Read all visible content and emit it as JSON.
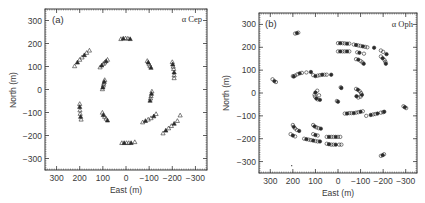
{
  "chart_data": [
    {
      "type": "scatter",
      "panel_label": "(a)",
      "title": "α Cep",
      "xlabel": "East (m)",
      "ylabel": "North (m)",
      "xlim": [
        350,
        -350
      ],
      "ylim": [
        -350,
        350
      ],
      "xticks": [
        300,
        200,
        100,
        0,
        -100,
        -200,
        -300
      ],
      "yticks": [
        300,
        200,
        100,
        0,
        -100,
        -200,
        -300
      ],
      "xtick_labels": [
        "300",
        "200",
        "100",
        "0",
        "−100",
        "−200",
        "−300"
      ],
      "ytick_labels": [
        "300",
        "200",
        "100",
        "0",
        "−100",
        "−200",
        "−300"
      ],
      "grid": false,
      "marker": "triangle",
      "series": [
        {
          "name": "top",
          "points": [
            [
              22,
              220
            ],
            [
              12,
              222
            ],
            [
              2,
              223
            ],
            [
              -8,
              222
            ],
            [
              -18,
              220
            ]
          ]
        },
        {
          "name": "upper-left-arc",
          "points": [
            [
              222,
              102
            ],
            [
              210,
              118
            ],
            [
              200,
              130
            ],
            [
              190,
              140
            ],
            [
              180,
              150
            ],
            [
              170,
              160
            ],
            [
              158,
              170
            ]
          ]
        },
        {
          "name": "inner-upper-left",
          "points": [
            [
              112,
              97
            ],
            [
              105,
              105
            ],
            [
              98,
              112
            ],
            [
              92,
              118
            ],
            [
              86,
              124
            ],
            [
              80,
              130
            ]
          ]
        },
        {
          "name": "inner-left",
          "points": [
            [
              102,
              2
            ],
            [
              100,
              10
            ],
            [
              98,
              18
            ],
            [
              96,
              26
            ],
            [
              94,
              34
            ],
            [
              92,
              42
            ]
          ]
        },
        {
          "name": "inner-upper-right",
          "points": [
            [
              -92,
              125
            ],
            [
              -96,
              118
            ],
            [
              -100,
              110
            ],
            [
              -104,
              102
            ],
            [
              -108,
              95
            ]
          ]
        },
        {
          "name": "far-upper-right",
          "points": [
            [
              -200,
              120
            ],
            [
              -202,
              110
            ],
            [
              -204,
              100
            ],
            [
              -206,
              90
            ],
            [
              -208,
              75
            ],
            [
              -208,
              62
            ],
            [
              -208,
              50
            ]
          ]
        },
        {
          "name": "inner-right",
          "points": [
            [
              -112,
              -8
            ],
            [
              -110,
              -18
            ],
            [
              -108,
              -28
            ],
            [
              -106,
              -38
            ],
            [
              -104,
              -48
            ]
          ]
        },
        {
          "name": "left-lower",
          "points": [
            [
              200,
              -62
            ],
            [
              200,
              -75
            ],
            [
              199,
              -90
            ],
            [
              198,
              -105
            ],
            [
              196,
              -118
            ],
            [
              194,
              -130
            ]
          ]
        },
        {
          "name": "inner-lower-left",
          "points": [
            [
              102,
              -100
            ],
            [
              98,
              -110
            ],
            [
              92,
              -118
            ],
            [
              86,
              -126
            ],
            [
              80,
              -134
            ]
          ]
        },
        {
          "name": "inner-lower-right",
          "points": [
            [
              -72,
              -142
            ],
            [
              -84,
              -136
            ],
            [
              -96,
              -130
            ],
            [
              -108,
              -124
            ],
            [
              -120,
              -116
            ],
            [
              -130,
              -106
            ]
          ]
        },
        {
          "name": "lower-right-arc",
          "points": [
            [
              -160,
              -190
            ],
            [
              -172,
              -178
            ],
            [
              -184,
              -168
            ],
            [
              -196,
              -158
            ],
            [
              -208,
              -148
            ],
            [
              -222,
              -136
            ],
            [
              -234,
              -112
            ]
          ]
        },
        {
          "name": "bottom",
          "points": [
            [
              18,
              -232
            ],
            [
              8,
              -232
            ],
            [
              -2,
              -232
            ],
            [
              -12,
              -232
            ],
            [
              -22,
              -232
            ],
            [
              -38,
              -228
            ]
          ]
        }
      ]
    },
    {
      "type": "scatter",
      "panel_label": "(b)",
      "title": "α Oph",
      "xlabel": "East (m)",
      "ylabel": "North (m)",
      "xlim": [
        350,
        -350
      ],
      "ylim": [
        -350,
        350
      ],
      "xticks": [
        300,
        200,
        100,
        0,
        -100,
        -200,
        -300
      ],
      "yticks": [
        300,
        200,
        100,
        0,
        -100,
        -200,
        -300
      ],
      "xtick_labels": [
        "300",
        "200",
        "100",
        "0",
        "−100",
        "−200",
        "−300"
      ],
      "ytick_labels": [
        "300",
        "200",
        "100",
        "0",
        "−100",
        "−200",
        "−300"
      ],
      "grid": false,
      "marker": "circle",
      "series": [
        {
          "name": "upper-left-pair",
          "points": [
            [
              190,
              260
            ],
            [
              182,
              262
            ],
            [
              176,
              264
            ]
          ]
        },
        {
          "name": "top-row-1",
          "points": [
            [
              0,
              218
            ],
            [
              -10,
              218
            ],
            [
              -20,
              218
            ],
            [
              -30,
              217
            ],
            [
              -40,
              216
            ],
            [
              -50,
              216
            ],
            [
              -70,
              212
            ],
            [
              -80,
              210
            ],
            [
              -90,
              208
            ],
            [
              -100,
              206
            ],
            [
              -110,
              204
            ],
            [
              -120,
              202
            ],
            [
              -130,
              200
            ],
            [
              -160,
              198
            ],
            [
              -190,
              186
            ],
            [
              -200,
              180
            ],
            [
              -215,
              170
            ]
          ]
        },
        {
          "name": "top-row-2",
          "points": [
            [
              0,
              182
            ],
            [
              -10,
              182
            ],
            [
              -20,
              182
            ],
            [
              -30,
              182
            ],
            [
              -40,
              182
            ],
            [
              -50,
              182
            ],
            [
              -85,
              178
            ],
            [
              -95,
              176
            ],
            [
              -115,
              172
            ]
          ]
        },
        {
          "name": "top-cluster-mid",
          "points": [
            [
              -80,
              148
            ],
            [
              -90,
              146
            ],
            [
              -100,
              140
            ],
            [
              -108,
              134
            ],
            [
              -114,
              128
            ]
          ]
        },
        {
          "name": "top-cluster-right",
          "points": [
            [
              -190,
              160
            ],
            [
              -198,
              152
            ],
            [
              -206,
              144
            ],
            [
              -210,
              136
            ],
            [
              -212,
              128
            ]
          ]
        },
        {
          "name": "left-pair",
          "points": [
            [
              290,
              60
            ],
            [
              282,
              52
            ],
            [
              275,
              48
            ]
          ]
        },
        {
          "name": "mid-row-left",
          "points": [
            [
              200,
              74
            ],
            [
              196,
              72
            ],
            [
              190,
              76
            ],
            [
              180,
              82
            ],
            [
              170,
              86
            ],
            [
              160,
              88
            ],
            [
              140,
              90
            ],
            [
              120,
              92
            ]
          ]
        },
        {
          "name": "mid-row-right",
          "points": [
            [
              110,
              78
            ],
            [
              100,
              74
            ],
            [
              90,
              76
            ],
            [
              80,
              78
            ],
            [
              70,
              80
            ],
            [
              60,
              80
            ],
            [
              50,
              80
            ],
            [
              30,
              80
            ]
          ]
        },
        {
          "name": "center-left-arc",
          "points": [
            [
              92,
              10
            ],
            [
              100,
              2
            ],
            [
              104,
              -8
            ],
            [
              102,
              -16
            ],
            [
              96,
              -24
            ],
            [
              90,
              -28
            ],
            [
              84,
              -10
            ],
            [
              80,
              -30
            ]
          ]
        },
        {
          "name": "center-top",
          "points": [
            [
              -12,
              25
            ],
            [
              -15,
              22
            ]
          ]
        },
        {
          "name": "center-bottom",
          "points": [
            [
              5,
              -35
            ],
            [
              0,
              -38
            ]
          ]
        },
        {
          "name": "center-right-arc",
          "points": [
            [
              -80,
              18
            ],
            [
              -88,
              14
            ],
            [
              -96,
              8
            ],
            [
              -102,
              0
            ],
            [
              -106,
              -8
            ],
            [
              -100,
              -16
            ],
            [
              -90,
              -20
            ],
            [
              -82,
              -14
            ]
          ]
        },
        {
          "name": "lower-row-left",
          "points": [
            [
              -30,
              -90
            ],
            [
              -40,
              -90
            ],
            [
              -50,
              -88
            ],
            [
              -60,
              -88
            ],
            [
              -70,
              -88
            ],
            [
              -80,
              -86
            ],
            [
              -90,
              -84
            ],
            [
              -100,
              -82
            ],
            [
              -110,
              -80
            ]
          ]
        },
        {
          "name": "lower-row-right",
          "points": [
            [
              -125,
              -100
            ],
            [
              -145,
              -96
            ],
            [
              -155,
              -94
            ],
            [
              -165,
              -92
            ],
            [
              -175,
              -90
            ],
            [
              -190,
              -86
            ],
            [
              -200,
              -84
            ],
            [
              -205,
              -82
            ]
          ]
        },
        {
          "name": "right-pair",
          "points": [
            [
              -290,
              -58
            ],
            [
              -296,
              -62
            ],
            [
              -302,
              -66
            ]
          ]
        },
        {
          "name": "lower-left-cluster",
          "points": [
            [
              200,
              -140
            ],
            [
              196,
              -148
            ],
            [
              190,
              -155
            ],
            [
              182,
              -162
            ],
            [
              172,
              -166
            ]
          ]
        },
        {
          "name": "lower-mid-cluster",
          "points": [
            [
              110,
              -140
            ],
            [
              104,
              -146
            ],
            [
              96,
              -150
            ],
            [
              86,
              -154
            ],
            [
              76,
              -156
            ]
          ]
        },
        {
          "name": "lower-row-a",
          "points": [
            [
              210,
              -180
            ],
            [
              200,
              -186
            ],
            [
              190,
              -190
            ]
          ]
        },
        {
          "name": "lower-row-b",
          "points": [
            [
              110,
              -180
            ],
            [
              100,
              -184
            ],
            [
              90,
              -186
            ]
          ]
        },
        {
          "name": "lower-row-c",
          "points": [
            [
              150,
              -200
            ],
            [
              140,
              -202
            ],
            [
              130,
              -204
            ],
            [
              120,
              -206
            ],
            [
              110,
              -208
            ],
            [
              100,
              -210
            ],
            [
              90,
              -212
            ],
            [
              80,
              -212
            ]
          ]
        },
        {
          "name": "lower-row-d",
          "points": [
            [
              50,
              -192
            ],
            [
              40,
              -192
            ],
            [
              30,
              -192
            ],
            [
              20,
              -192
            ],
            [
              10,
              -192
            ],
            [
              0,
              -192
            ],
            [
              -10,
              -192
            ]
          ]
        },
        {
          "name": "lower-row-e",
          "points": [
            [
              50,
              -222
            ],
            [
              40,
              -224
            ],
            [
              30,
              -226
            ],
            [
              20,
              -226
            ],
            [
              10,
              -226
            ],
            [
              -5,
              -226
            ],
            [
              -15,
              -226
            ]
          ]
        },
        {
          "name": "bottom-right-pair",
          "points": [
            [
              -190,
              -275
            ],
            [
              -198,
              -272
            ],
            [
              -204,
              -268
            ]
          ]
        },
        {
          "name": "stray-dot",
          "points": [
            [
              205,
              -318
            ]
          ]
        }
      ]
    }
  ],
  "panels": {
    "a": {
      "label": "(a)",
      "star": "α Cep",
      "xlabel": "East (m)",
      "ylabel": "North (m)"
    },
    "b": {
      "label": "(b)",
      "star": "α Oph",
      "xlabel": "East (m)",
      "ylabel": "North (m)"
    }
  },
  "colors": {
    "frame": "#3a3a3a",
    "marker_stroke": "#2a2a2a",
    "marker_fill_dark": "#2a2a2a",
    "background": "#ffffff"
  }
}
